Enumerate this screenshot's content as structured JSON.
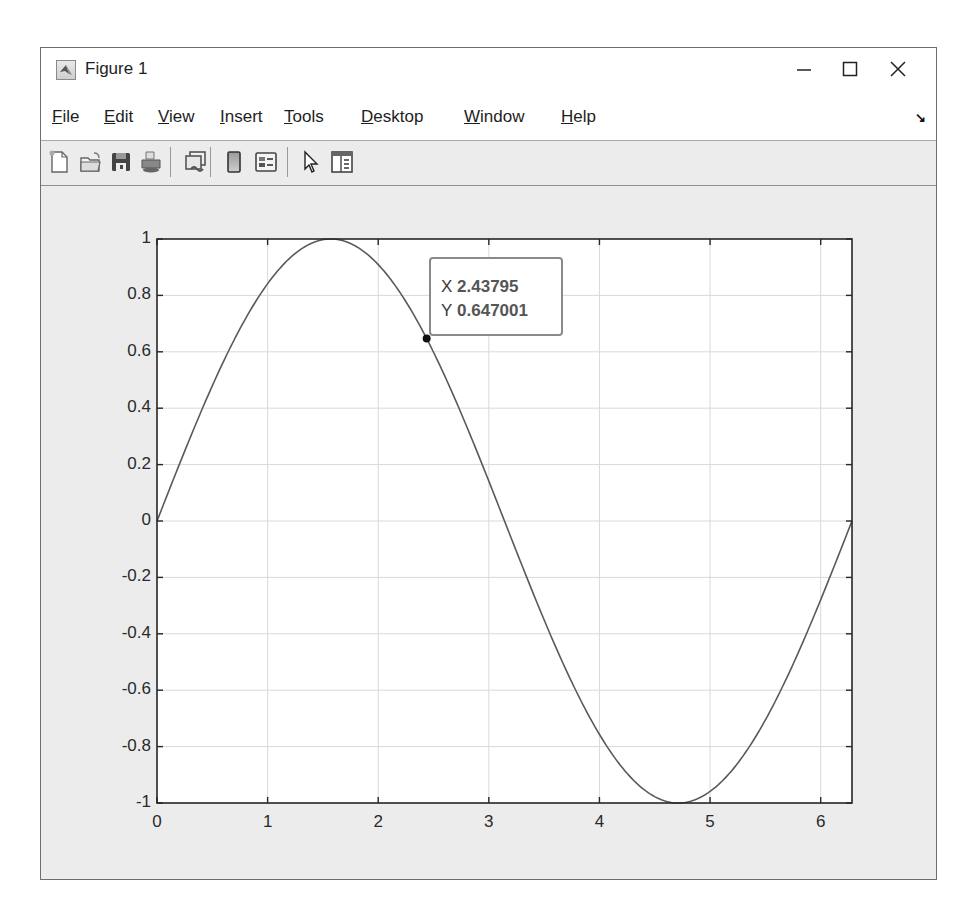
{
  "window": {
    "title": "Figure 1",
    "controls": {
      "minimize": "—",
      "maximize": "☐",
      "close": "✕"
    }
  },
  "menubar": {
    "items": [
      {
        "label": "File",
        "accel": "F"
      },
      {
        "label": "Edit",
        "accel": "E"
      },
      {
        "label": "View",
        "accel": "V"
      },
      {
        "label": "Insert",
        "accel": "I"
      },
      {
        "label": "Tools",
        "accel": "T"
      },
      {
        "label": "Desktop",
        "accel": "D"
      },
      {
        "label": "Window",
        "accel": "W"
      },
      {
        "label": "Help",
        "accel": "H"
      }
    ],
    "dock_icon": "dock-arrow-icon"
  },
  "toolbar": {
    "buttons": [
      {
        "name": "new-figure-button",
        "icon": "new-file-icon"
      },
      {
        "name": "open-file-button",
        "icon": "folder-open-icon"
      },
      {
        "name": "save-figure-button",
        "icon": "floppy-disk-icon"
      },
      {
        "name": "print-figure-button",
        "icon": "printer-icon"
      },
      {
        "name": "link-plot-button",
        "icon": "link-plot-icon"
      },
      {
        "name": "insert-colorbar-button",
        "icon": "colorbar-icon"
      },
      {
        "name": "insert-legend-button",
        "icon": "legend-icon"
      },
      {
        "name": "edit-plot-button",
        "icon": "pointer-arrow-icon"
      },
      {
        "name": "show-plot-tools-button",
        "icon": "plot-tools-icon"
      }
    ]
  },
  "datatip": {
    "x_label": "X",
    "x_value": "2.43795",
    "y_label": "Y",
    "y_value": "0.647001"
  },
  "colors": {
    "line": "#5a5a5a",
    "grid": "#d9d9d9",
    "axes": "#262626",
    "figure_bg": "#ececec"
  },
  "chart_data": {
    "type": "line",
    "title": "",
    "xlabel": "",
    "ylabel": "",
    "function": "y = sin(x)",
    "xlim": [
      0,
      6.2832
    ],
    "ylim": [
      -1,
      1
    ],
    "grid": true,
    "legend": null,
    "xticks": [
      0,
      1,
      2,
      3,
      4,
      5,
      6
    ],
    "xtick_labels": [
      "0",
      "1",
      "2",
      "3",
      "4",
      "5",
      "6"
    ],
    "yticks": [
      1,
      0.8,
      0.6,
      0.4,
      0.2,
      0,
      -0.2,
      -0.4,
      -0.6,
      -0.8,
      -1
    ],
    "ytick_labels": [
      "1",
      "0.8",
      "0.6",
      "0.4",
      "0.2",
      "0",
      "-0.2",
      "-0.4",
      "-0.6",
      "-0.8",
      "-1"
    ],
    "series": [
      {
        "name": "sin(x)",
        "x": [
          0,
          0.5236,
          1.0472,
          1.5708,
          2.0944,
          2.618,
          3.1416,
          3.6652,
          4.1888,
          4.7124,
          5.236,
          5.7596,
          6.2832
        ],
        "y": [
          0,
          0.5,
          0.866,
          1,
          0.866,
          0.5,
          0,
          -0.5,
          -0.866,
          -1,
          -0.866,
          -0.5,
          0
        ]
      }
    ],
    "annotations": [
      {
        "type": "datatip",
        "x": 2.43795,
        "y": 0.647001
      }
    ]
  }
}
